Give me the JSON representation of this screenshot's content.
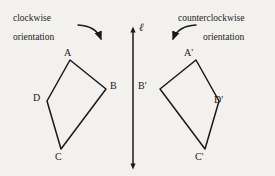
{
  "figure": {
    "background_color": "#f2f1ee",
    "ink_color": "#1b1917",
    "captions": {
      "left_orientation_word": "clockwise",
      "left_orientation_noun": "orientation",
      "right_orientation_word": "counterclockwise",
      "right_orientation_noun": "orientation"
    },
    "mirror_line": {
      "label": "ℓ",
      "x": 133,
      "y_top": 27,
      "y_bottom": 168,
      "has_arrowheads": true
    },
    "left_polygon": {
      "name": "ABCD",
      "orientation": "clockwise",
      "vertices": [
        {
          "label": "A",
          "x": 70,
          "y": 60
        },
        {
          "label": "B",
          "x": 106,
          "y": 89
        },
        {
          "label": "C",
          "x": 61,
          "y": 149
        },
        {
          "label": "D",
          "x": 47,
          "y": 101
        }
      ]
    },
    "right_polygon": {
      "name": "A'B'C'D'",
      "orientation": "counterclockwise",
      "vertices": [
        {
          "label": "A'",
          "x": 196,
          "y": 60
        },
        {
          "label": "B'",
          "x": 160,
          "y": 89
        },
        {
          "label": "C'",
          "x": 205,
          "y": 149
        },
        {
          "label": "D'",
          "x": 219,
          "y": 101
        }
      ]
    },
    "arrows": [
      {
        "name": "clockwise-arrow",
        "path": "M 78 24 Q 95 26 100 40",
        "arrowhead_at": "end"
      },
      {
        "name": "counterclockwise-arrow",
        "path": "M 196 24 Q 179 26 174 40",
        "arrowhead_at": "end"
      }
    ]
  }
}
